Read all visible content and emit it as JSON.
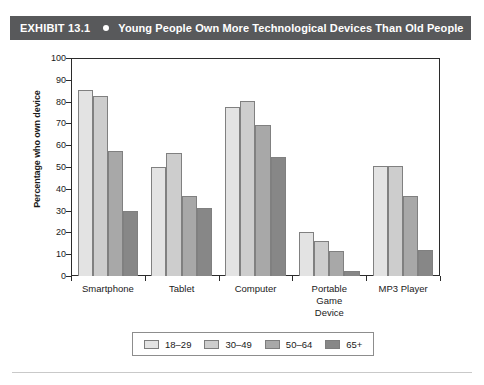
{
  "exhibit": {
    "label": "EXHIBIT 13.1",
    "bullet_icon": "bullet-dot-icon",
    "title": "Young People Own More Technological Devices Than Old People",
    "bar_color": "#58595b",
    "text_color": "#ffffff"
  },
  "chart_data": {
    "type": "bar",
    "title": "Young People Own More Technological Devices Than Old People",
    "xlabel": "",
    "ylabel": "Percentage who own device",
    "ylim": [
      0,
      100
    ],
    "ytick_step": 10,
    "yticks": [
      0,
      10,
      20,
      30,
      40,
      50,
      60,
      70,
      80,
      90,
      100
    ],
    "ytick_labels": [
      "0",
      "10",
      "20",
      "30",
      "40",
      "50",
      "60",
      "70",
      "80",
      "90",
      "100"
    ],
    "grid": false,
    "legend_position": "bottom",
    "categories": [
      "Smartphone",
      "Tablet",
      "Computer",
      "Portable Game Device",
      "MP3 Player"
    ],
    "category_labels": [
      [
        "Smartphone"
      ],
      [
        "Tablet"
      ],
      [
        "Computer"
      ],
      [
        "Portable",
        "Game",
        "Device"
      ],
      [
        "MP3 Player"
      ]
    ],
    "series": [
      {
        "name": "18–29",
        "color": "#e3e3e3",
        "values": [
          85.5,
          50.0,
          77.5,
          20.0,
          50.5
        ]
      },
      {
        "name": "30–49",
        "color": "#cdcdcd",
        "values": [
          82.5,
          56.5,
          80.5,
          16.0,
          50.5
        ]
      },
      {
        "name": "50–64",
        "color": "#a8a8a8",
        "values": [
          57.5,
          36.5,
          69.5,
          11.5,
          36.5
        ]
      },
      {
        "name": "65+",
        "color": "#878787",
        "values": [
          30.0,
          31.0,
          54.5,
          2.5,
          12.0
        ]
      }
    ]
  },
  "legend": {
    "items": [
      {
        "label": "18–29",
        "color": "#e3e3e3"
      },
      {
        "label": "30–49",
        "color": "#cdcdcd"
      },
      {
        "label": "50–64",
        "color": "#a8a8a8"
      },
      {
        "label": "65+",
        "color": "#878787"
      }
    ]
  }
}
